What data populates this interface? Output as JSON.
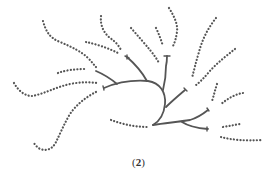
{
  "figure": {
    "caption_open": "(",
    "caption_number": "2",
    "caption_close": ")",
    "stroke_color": "#555555",
    "background": "#ffffff"
  }
}
